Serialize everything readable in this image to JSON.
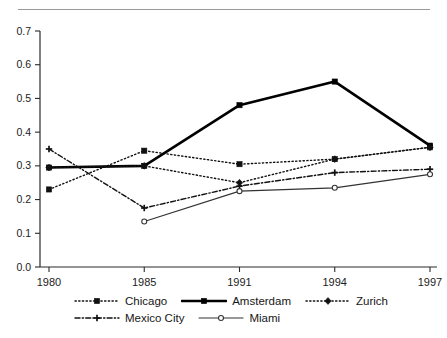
{
  "title": "",
  "chart_data": {
    "type": "line",
    "title": "",
    "xlabel": "",
    "ylabel": "",
    "categories": [
      "1980",
      "1985",
      "1991",
      "1994",
      "1997"
    ],
    "ylim": [
      0.0,
      0.7
    ],
    "yticks": [
      "0.0",
      "0.1",
      "0.2",
      "0.3",
      "0.4",
      "0.5",
      "0.6",
      "0.7"
    ],
    "ytick_values": [
      0.0,
      0.1,
      0.2,
      0.3,
      0.4,
      0.5,
      0.6,
      0.7
    ],
    "grid": false,
    "legend_position": "bottom",
    "series": [
      {
        "name": "Chicago",
        "values": [
          0.23,
          0.345,
          0.305,
          0.32,
          0.355
        ],
        "line_style": "dotted",
        "marker": "square",
        "color": "#111111",
        "width": 1.4
      },
      {
        "name": "Amsterdam",
        "values": [
          0.295,
          0.3,
          0.48,
          0.55,
          0.36
        ],
        "line_style": "solid",
        "marker": "square",
        "color": "#000000",
        "width": 2.6
      },
      {
        "name": "Zurich",
        "values": [
          0.295,
          0.3,
          0.25,
          0.32,
          0.355
        ],
        "line_style": "dashed",
        "marker": "diamond",
        "color": "#111111",
        "width": 1.4
      },
      {
        "name": "Mexico City",
        "values": [
          0.35,
          0.175,
          0.24,
          0.28,
          0.29
        ],
        "line_style": "dash-dot",
        "marker": "plus",
        "color": "#111111",
        "width": 1.4
      },
      {
        "name": "Miami",
        "values": [
          null,
          0.135,
          0.225,
          0.235,
          0.275
        ],
        "line_style": "solid",
        "marker": "circle",
        "color": "#333333",
        "width": 1.2
      }
    ]
  },
  "legend": {
    "rows": [
      [
        "Chicago",
        "Amsterdam",
        "Zurich"
      ],
      [
        "Mexico City",
        "Miami"
      ]
    ]
  },
  "axes": {
    "axis_color": "#2b2b2b",
    "tick_label_color": "#1b1b1b"
  }
}
